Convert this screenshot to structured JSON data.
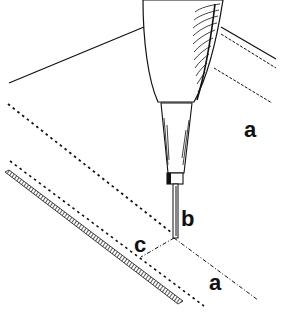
{
  "figure": {
    "labels": {
      "a_top": "a",
      "b": "b",
      "c": "c",
      "a_bottom": "a"
    },
    "colors": {
      "ink": "#111111",
      "background": "#ffffff"
    }
  }
}
